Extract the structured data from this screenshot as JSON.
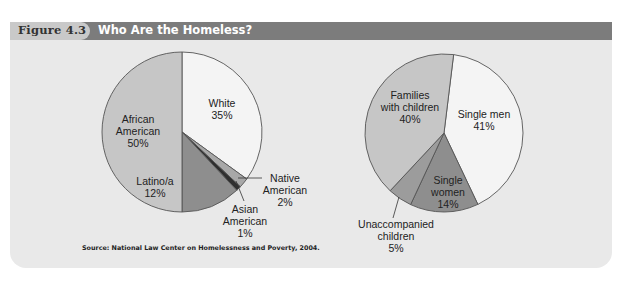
{
  "figure": {
    "number_label": "Figure 4.3",
    "title": "Who Are the Homeless?",
    "source": "Source: National Law Center on Homelessness and Poverty, 2004."
  },
  "chart_data": [
    {
      "type": "pie",
      "title": "Homeless by race/ethnicity",
      "start": "top",
      "direction": "clockwise",
      "slices": [
        {
          "label": "White",
          "value": 35,
          "value_label": "35%",
          "color": "#f4f4f4"
        },
        {
          "label": "Native American",
          "value": 2,
          "value_label": "2%",
          "color": "#a8a8a8"
        },
        {
          "label": "Asian American",
          "value": 1,
          "value_label": "1%",
          "color": "#2f2f2f"
        },
        {
          "label": "Latino/a",
          "value": 12,
          "value_label": "12%",
          "color": "#8e8e8e"
        },
        {
          "label": "African American",
          "value": 50,
          "value_label": "50%",
          "color": "#c6c6c6"
        }
      ]
    },
    {
      "type": "pie",
      "title": "Homeless by household type",
      "start": "top",
      "direction": "clockwise",
      "slices": [
        {
          "label": "Single men",
          "value": 41,
          "value_label": "41%",
          "color": "#f4f4f4"
        },
        {
          "label": "Single women",
          "value": 14,
          "value_label": "14%",
          "color": "#8e8e8e"
        },
        {
          "label": "Unaccompanied children",
          "value": 5,
          "value_label": "5%",
          "color": "#9c9c9c"
        },
        {
          "label": "Families with children",
          "value": 40,
          "value_label": "40%",
          "color": "#c6c6c6"
        }
      ]
    }
  ],
  "labels": {
    "left": [
      {
        "lines": [
          "White",
          "35%"
        ]
      },
      {
        "lines": [
          "Native",
          "American",
          "2%"
        ]
      },
      {
        "lines": [
          "Asian",
          "American",
          "1%"
        ]
      },
      {
        "lines": [
          "Latino/a",
          "12%"
        ]
      },
      {
        "lines": [
          "African",
          "American",
          "50%"
        ]
      }
    ],
    "right": [
      {
        "lines": [
          "Single men",
          "41%"
        ]
      },
      {
        "lines": [
          "Single",
          "women",
          "14%"
        ]
      },
      {
        "lines": [
          "Unaccompanied",
          "children",
          "5%"
        ]
      },
      {
        "lines": [
          "Families",
          "with children",
          "40%"
        ]
      }
    ]
  }
}
